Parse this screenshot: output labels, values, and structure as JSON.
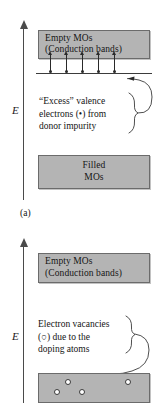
{
  "figure": {
    "panels": [
      {
        "id": "a",
        "caption": "(a)",
        "axis_label": "E",
        "conduction_band": {
          "line1": "Empty MOs",
          "line2": "(Conduction bands)"
        },
        "valence_band": {
          "line1": "Filled",
          "line2": "MOs"
        },
        "annotation": {
          "line1": "“Excess” valence",
          "line2": "electrons (•) from",
          "line3": "donor impurity"
        },
        "carrier_count": 5,
        "carrier_symbol": "•"
      },
      {
        "id": "b",
        "caption": "",
        "axis_label": "E",
        "conduction_band": {
          "line1": "Empty MOs",
          "line2": "(Conduction bands)"
        },
        "valence_band": {
          "line1": "",
          "line2": ""
        },
        "annotation": {
          "line1": "Electron vacancies",
          "line2": "(○) due to the",
          "line3": "doping atoms"
        },
        "carrier_count": 4,
        "carrier_symbol": "○"
      }
    ],
    "colors": {
      "band_fill": "#b4b4b4",
      "band_stroke": "#6b6b6b",
      "ink": "#1a1a1a",
      "background": "#ffffff"
    }
  }
}
